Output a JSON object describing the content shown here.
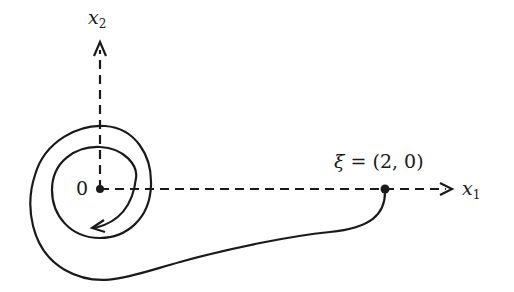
{
  "diagram": {
    "axes": {
      "x1": {
        "name": "x",
        "subscript": "1"
      },
      "x2": {
        "name": "x",
        "subscript": "2"
      }
    },
    "origin_label": "0",
    "point": {
      "symbol": "ξ",
      "equals": " = ",
      "value": "(2, 0)"
    },
    "colors": {
      "stroke": "#1a1a1a",
      "background": "#ffffff"
    }
  }
}
